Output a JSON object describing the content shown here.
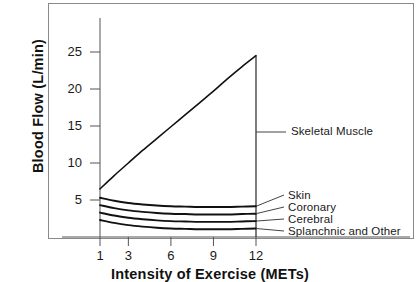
{
  "chart_data": {
    "type": "area",
    "title": "",
    "xlabel": "Intensity of Exercise (METs)",
    "ylabel": "Blood Flow (L/min)",
    "xlim": [
      0,
      13.2
    ],
    "ylim": [
      0,
      27.5
    ],
    "xticks": [
      1,
      3,
      6,
      9,
      12
    ],
    "xtick_labels": [
      "1",
      "3",
      "6",
      "9",
      "12"
    ],
    "yticks": [
      5,
      10,
      15,
      20,
      25
    ],
    "ytick_labels": [
      "5",
      "10",
      "15",
      "20",
      "25"
    ],
    "grid": false,
    "legend_position": "right-inline-leader-lines",
    "x": [
      1,
      2,
      3,
      4,
      5,
      6,
      7,
      8,
      9,
      10,
      11,
      12
    ],
    "series": [
      {
        "name": "Skeletal Muscle",
        "label": "Skeletal Muscle",
        "values": [
          6.5,
          8.3,
          10.0,
          11.7,
          13.3,
          14.9,
          16.5,
          18.1,
          19.7,
          21.4,
          23.0,
          24.5
        ]
      },
      {
        "name": "Skin",
        "label": "Skin",
        "values": [
          5.3,
          4.9,
          4.6,
          4.4,
          4.25,
          4.15,
          4.1,
          4.05,
          4.05,
          4.05,
          4.1,
          4.15
        ]
      },
      {
        "name": "Coronary",
        "label": "Coronary",
        "values": [
          4.3,
          3.9,
          3.6,
          3.4,
          3.25,
          3.15,
          3.1,
          3.05,
          3.05,
          3.05,
          3.1,
          3.15
        ]
      },
      {
        "name": "Cerebral",
        "label": "Cerebral",
        "values": [
          3.3,
          2.9,
          2.6,
          2.4,
          2.25,
          2.15,
          2.1,
          2.05,
          2.05,
          2.05,
          2.1,
          2.15
        ]
      },
      {
        "name": "Splanchnic and Other",
        "label": "Splanchnic and Other",
        "values": [
          2.3,
          1.9,
          1.6,
          1.4,
          1.25,
          1.15,
          1.1,
          1.05,
          1.05,
          1.05,
          1.1,
          1.15
        ]
      }
    ],
    "colors": {
      "line": "#111111",
      "axis": "#555555",
      "frame": "#8a8a8a",
      "text": "#1a1a1a"
    }
  }
}
